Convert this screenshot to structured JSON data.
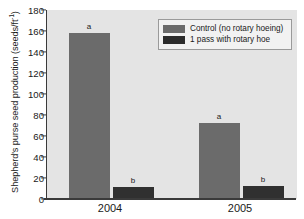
{
  "chart_data": {
    "type": "bar",
    "title": "",
    "xlabel": "",
    "ylabel": "Shepherd's purse seed production (seeds/ft",
    "ylabel_superscript": "-1",
    "ylabel_suffix": ")",
    "categories": [
      "2004",
      "2005"
    ],
    "ylim": [
      0,
      180
    ],
    "yticks": [
      0,
      20,
      40,
      60,
      80,
      100,
      120,
      140,
      160,
      180
    ],
    "ytick_labels": [
      "0",
      "20",
      "40",
      "60",
      "80",
      "100",
      "120",
      "140",
      "160",
      "180"
    ],
    "grid": false,
    "legend_position": "top-right",
    "series": [
      {
        "name": "Control (no rotary hoeing)",
        "color": "#6b6b6b",
        "values": [
          158,
          72
        ],
        "annotations": [
          "a",
          "a"
        ]
      },
      {
        "name": "1 pass with rotary hoe",
        "color": "#303030",
        "values": [
          11.5,
          12
        ],
        "annotations": [
          "b",
          "b"
        ]
      }
    ],
    "annotations_note": "Letters a/b denote statistical significance groupings"
  },
  "legend": {
    "items": [
      {
        "label": "Control (no rotary hoeing)",
        "swatch": "control"
      },
      {
        "label": "1 pass with rotary hoe",
        "swatch": "treat"
      }
    ]
  },
  "axis": {
    "y_tick_0": "0",
    "y_tick_1": "20",
    "y_tick_2": "40",
    "y_tick_3": "60",
    "y_tick_4": "80",
    "y_tick_5": "100",
    "y_tick_6": "120",
    "y_tick_7": "140",
    "y_tick_8": "160",
    "y_tick_9": "180",
    "x_label_0": "2004",
    "x_label_1": "2005"
  },
  "bars": {
    "b0_sig": "a",
    "b1_sig": "b",
    "b2_sig": "a",
    "b3_sig": "b"
  }
}
